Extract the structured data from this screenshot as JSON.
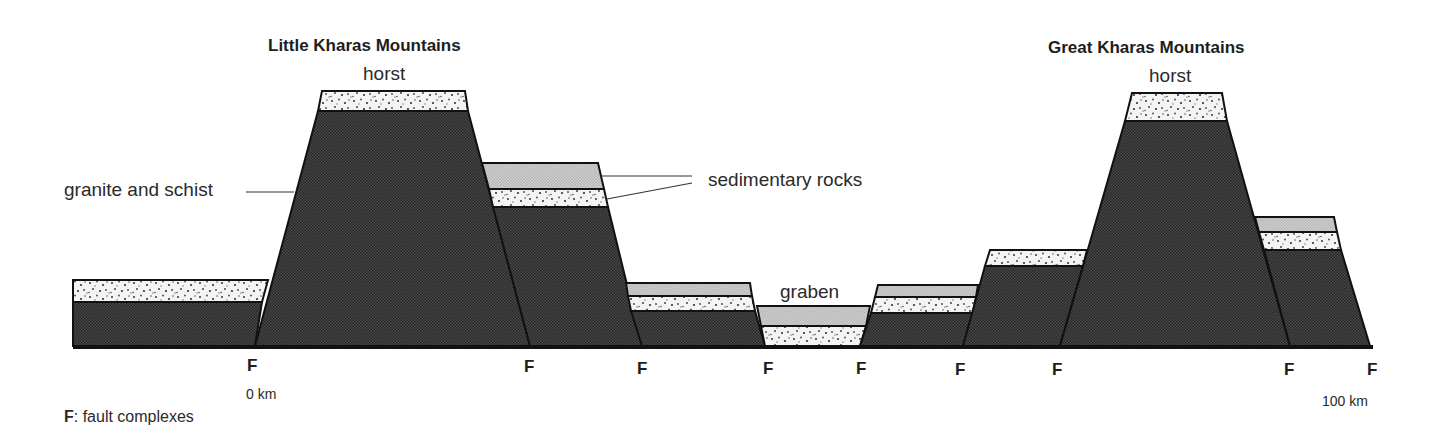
{
  "diagram": {
    "titles": {
      "left": "Little Kharas Mountains",
      "right": "Great Kharas Mountains"
    },
    "labels": {
      "horst_left": "horst",
      "horst_right": "horst",
      "graben": "graben",
      "granite": "granite and schist",
      "sedimentary": "sedimentary rocks"
    },
    "faults": [
      "F",
      "F",
      "F",
      "F",
      "F",
      "F",
      "F",
      "F",
      "F"
    ],
    "scale": {
      "start": "0 km",
      "end": "100 km"
    },
    "legend": {
      "key": "F",
      "text": ": fault complexes"
    },
    "colors": {
      "granite": "#3a3a3a",
      "sediment_gray": "#c8c8c8",
      "sandstone": "#f1f1f1",
      "outline": "#111111"
    }
  }
}
